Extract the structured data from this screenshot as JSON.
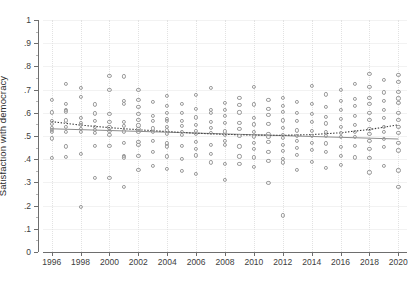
{
  "figure": {
    "background": "#ffffff",
    "marker_color": "#9a9a9a",
    "linear_fit_color": "#8c8c8c",
    "curve_fit_color": "#3a3a3a"
  },
  "axes": {
    "y_title": "Satisfaction with democracy",
    "x_title": "",
    "y_ticklabels": [
      "0",
      ".1",
      ".2",
      ".3",
      ".4",
      ".5",
      ".6",
      ".7",
      ".8",
      ".9",
      "1"
    ],
    "x_ticklabels": [
      "1996",
      "1998",
      "2000",
      "2002",
      "2004",
      "2006",
      "2008",
      "2010",
      "2012",
      "2014",
      "2016",
      "2018",
      "2020"
    ]
  },
  "chart_data": {
    "type": "scatter",
    "title": "",
    "xlabel": "",
    "ylabel": "Satisfaction with democracy",
    "xlim": [
      1995.4,
      2020.6
    ],
    "ylim": [
      0,
      1
    ],
    "ytick_values": [
      0,
      0.1,
      0.2,
      0.3,
      0.4,
      0.5,
      0.6,
      0.7,
      0.8,
      0.9,
      1
    ],
    "xtick_values": [
      1996,
      1998,
      2000,
      2002,
      2004,
      2006,
      2008,
      2010,
      2012,
      2014,
      2016,
      2018,
      2020
    ],
    "grid": "horizontal solid light gray, vertical dotted light gray",
    "legend": "none",
    "marker": "open circle",
    "points": [
      [
        1996,
        0.655
      ],
      [
        1996,
        0.602
      ],
      [
        1996,
        0.565
      ],
      [
        1996,
        0.553
      ],
      [
        1996,
        0.535
      ],
      [
        1996,
        0.527
      ],
      [
        1996,
        0.519
      ],
      [
        1996,
        0.49
      ],
      [
        1996,
        0.404
      ],
      [
        1997,
        0.724
      ],
      [
        1997,
        0.638
      ],
      [
        1997,
        0.614
      ],
      [
        1997,
        0.606
      ],
      [
        1997,
        0.567
      ],
      [
        1997,
        0.54
      ],
      [
        1997,
        0.519
      ],
      [
        1997,
        0.455
      ],
      [
        1997,
        0.409
      ],
      [
        1998,
        0.708
      ],
      [
        1998,
        0.668
      ],
      [
        1998,
        0.578
      ],
      [
        1998,
        0.556
      ],
      [
        1998,
        0.548
      ],
      [
        1998,
        0.532
      ],
      [
        1998,
        0.519
      ],
      [
        1998,
        0.423
      ],
      [
        1998,
        0.196
      ],
      [
        1999,
        0.636
      ],
      [
        1999,
        0.597
      ],
      [
        1999,
        0.566
      ],
      [
        1999,
        0.538
      ],
      [
        1999,
        0.528
      ],
      [
        1999,
        0.512
      ],
      [
        1999,
        0.456
      ],
      [
        1999,
        0.32
      ],
      [
        2000,
        0.76
      ],
      [
        2000,
        0.7
      ],
      [
        2000,
        0.595
      ],
      [
        2000,
        0.561
      ],
      [
        2000,
        0.537
      ],
      [
        2000,
        0.523
      ],
      [
        2000,
        0.503
      ],
      [
        2000,
        0.459
      ],
      [
        2000,
        0.32
      ],
      [
        2001,
        0.757
      ],
      [
        2001,
        0.651
      ],
      [
        2001,
        0.638
      ],
      [
        2001,
        0.56
      ],
      [
        2001,
        0.545
      ],
      [
        2001,
        0.52
      ],
      [
        2001,
        0.47
      ],
      [
        2001,
        0.415
      ],
      [
        2001,
        0.408
      ],
      [
        2001,
        0.279
      ],
      [
        2002,
        0.7
      ],
      [
        2002,
        0.655
      ],
      [
        2002,
        0.627
      ],
      [
        2002,
        0.596
      ],
      [
        2002,
        0.57
      ],
      [
        2002,
        0.546
      ],
      [
        2002,
        0.53
      ],
      [
        2002,
        0.52
      ],
      [
        2002,
        0.474
      ],
      [
        2002,
        0.462
      ],
      [
        2002,
        0.415
      ],
      [
        2002,
        0.355
      ],
      [
        2003,
        0.648
      ],
      [
        2003,
        0.588
      ],
      [
        2003,
        0.565
      ],
      [
        2003,
        0.533
      ],
      [
        2003,
        0.517
      ],
      [
        2003,
        0.48
      ],
      [
        2003,
        0.43
      ],
      [
        2003,
        0.372
      ],
      [
        2004,
        0.672
      ],
      [
        2004,
        0.63
      ],
      [
        2004,
        0.601
      ],
      [
        2004,
        0.575
      ],
      [
        2004,
        0.564
      ],
      [
        2004,
        0.538
      ],
      [
        2004,
        0.524
      ],
      [
        2004,
        0.509
      ],
      [
        2004,
        0.468
      ],
      [
        2004,
        0.455
      ],
      [
        2004,
        0.412
      ],
      [
        2004,
        0.359
      ],
      [
        2005,
        0.64
      ],
      [
        2005,
        0.598
      ],
      [
        2005,
        0.566
      ],
      [
        2005,
        0.545
      ],
      [
        2005,
        0.518
      ],
      [
        2005,
        0.505
      ],
      [
        2005,
        0.458
      ],
      [
        2005,
        0.4
      ],
      [
        2005,
        0.351
      ],
      [
        2006,
        0.676
      ],
      [
        2006,
        0.618
      ],
      [
        2006,
        0.58
      ],
      [
        2006,
        0.548
      ],
      [
        2006,
        0.521
      ],
      [
        2006,
        0.51
      ],
      [
        2006,
        0.473
      ],
      [
        2006,
        0.443
      ],
      [
        2006,
        0.416
      ],
      [
        2006,
        0.338
      ],
      [
        2007,
        0.706
      ],
      [
        2007,
        0.612
      ],
      [
        2007,
        0.598
      ],
      [
        2007,
        0.562
      ],
      [
        2007,
        0.536
      ],
      [
        2007,
        0.513
      ],
      [
        2007,
        0.462
      ],
      [
        2007,
        0.422
      ],
      [
        2007,
        0.386
      ],
      [
        2008,
        0.644
      ],
      [
        2008,
        0.612
      ],
      [
        2008,
        0.588
      ],
      [
        2008,
        0.556
      ],
      [
        2008,
        0.52
      ],
      [
        2008,
        0.505
      ],
      [
        2008,
        0.478
      ],
      [
        2008,
        0.46
      ],
      [
        2008,
        0.381
      ],
      [
        2008,
        0.31
      ],
      [
        2009,
        0.663
      ],
      [
        2009,
        0.635
      ],
      [
        2009,
        0.602
      ],
      [
        2009,
        0.558
      ],
      [
        2009,
        0.53
      ],
      [
        2009,
        0.5
      ],
      [
        2009,
        0.455
      ],
      [
        2009,
        0.412
      ],
      [
        2009,
        0.38
      ],
      [
        2010,
        0.713
      ],
      [
        2010,
        0.636
      ],
      [
        2010,
        0.578
      ],
      [
        2010,
        0.55
      ],
      [
        2010,
        0.516
      ],
      [
        2010,
        0.498
      ],
      [
        2010,
        0.47
      ],
      [
        2010,
        0.444
      ],
      [
        2010,
        0.408
      ],
      [
        2010,
        0.368
      ],
      [
        2011,
        0.657
      ],
      [
        2011,
        0.618
      ],
      [
        2011,
        0.59
      ],
      [
        2011,
        0.551
      ],
      [
        2011,
        0.508
      ],
      [
        2011,
        0.495
      ],
      [
        2011,
        0.475
      ],
      [
        2011,
        0.43
      ],
      [
        2011,
        0.393
      ],
      [
        2011,
        0.297
      ],
      [
        2012,
        0.663
      ],
      [
        2012,
        0.631
      ],
      [
        2012,
        0.604
      ],
      [
        2012,
        0.567
      ],
      [
        2012,
        0.536
      ],
      [
        2012,
        0.506
      ],
      [
        2012,
        0.491
      ],
      [
        2012,
        0.463
      ],
      [
        2012,
        0.437
      ],
      [
        2012,
        0.403
      ],
      [
        2012,
        0.386
      ],
      [
        2012,
        0.158
      ],
      [
        2013,
        0.648
      ],
      [
        2013,
        0.6
      ],
      [
        2013,
        0.566
      ],
      [
        2013,
        0.524
      ],
      [
        2013,
        0.501
      ],
      [
        2013,
        0.48
      ],
      [
        2013,
        0.447
      ],
      [
        2013,
        0.418
      ],
      [
        2013,
        0.355
      ],
      [
        2014,
        0.717
      ],
      [
        2014,
        0.64
      ],
      [
        2014,
        0.596
      ],
      [
        2014,
        0.561
      ],
      [
        2014,
        0.521
      ],
      [
        2014,
        0.502
      ],
      [
        2014,
        0.471
      ],
      [
        2014,
        0.44
      ],
      [
        2014,
        0.39
      ],
      [
        2015,
        0.679
      ],
      [
        2015,
        0.625
      ],
      [
        2015,
        0.584
      ],
      [
        2015,
        0.554
      ],
      [
        2015,
        0.517
      ],
      [
        2015,
        0.5
      ],
      [
        2015,
        0.468
      ],
      [
        2015,
        0.43
      ],
      [
        2015,
        0.364
      ],
      [
        2016,
        0.697
      ],
      [
        2016,
        0.652
      ],
      [
        2016,
        0.613
      ],
      [
        2016,
        0.572
      ],
      [
        2016,
        0.54
      ],
      [
        2016,
        0.512
      ],
      [
        2016,
        0.495
      ],
      [
        2016,
        0.452
      ],
      [
        2016,
        0.415
      ],
      [
        2016,
        0.377
      ],
      [
        2017,
        0.723
      ],
      [
        2017,
        0.66
      ],
      [
        2017,
        0.628
      ],
      [
        2017,
        0.586
      ],
      [
        2017,
        0.549
      ],
      [
        2017,
        0.517
      ],
      [
        2017,
        0.497
      ],
      [
        2017,
        0.458
      ],
      [
        2017,
        0.408
      ],
      [
        2018,
        0.768
      ],
      [
        2018,
        0.712
      ],
      [
        2018,
        0.664
      ],
      [
        2018,
        0.64
      ],
      [
        2018,
        0.601
      ],
      [
        2018,
        0.57
      ],
      [
        2018,
        0.531
      ],
      [
        2018,
        0.509
      ],
      [
        2018,
        0.48
      ],
      [
        2018,
        0.443
      ],
      [
        2018,
        0.407
      ],
      [
        2018,
        0.343
      ],
      [
        2019,
        0.742
      ],
      [
        2019,
        0.688
      ],
      [
        2019,
        0.65
      ],
      [
        2019,
        0.612
      ],
      [
        2019,
        0.578
      ],
      [
        2019,
        0.54
      ],
      [
        2019,
        0.518
      ],
      [
        2019,
        0.486
      ],
      [
        2019,
        0.452
      ],
      [
        2019,
        0.372
      ],
      [
        2020,
        0.765
      ],
      [
        2020,
        0.733
      ],
      [
        2020,
        0.69
      ],
      [
        2020,
        0.662
      ],
      [
        2020,
        0.641
      ],
      [
        2020,
        0.6
      ],
      [
        2020,
        0.57
      ],
      [
        2020,
        0.538
      ],
      [
        2020,
        0.512
      ],
      [
        2020,
        0.47
      ],
      [
        2020,
        0.438
      ],
      [
        2020,
        0.352
      ],
      [
        2020,
        0.281
      ]
    ],
    "fits": [
      {
        "name": "linear-fit",
        "style": "solid",
        "color": "#8c8c8c",
        "x": [
          1996,
          2020
        ],
        "y": [
          0.531,
          0.487
        ]
      },
      {
        "name": "quadratic-fit",
        "style": "dotted",
        "color": "#3a3a3a",
        "x": [
          1996,
          1998,
          2000,
          2002,
          2004,
          2006,
          2008,
          2010,
          2012,
          2014,
          2016,
          2018,
          2020
        ],
        "y": [
          0.562,
          0.547,
          0.536,
          0.527,
          0.519,
          0.512,
          0.507,
          0.504,
          0.503,
          0.506,
          0.514,
          0.528,
          0.548
        ]
      }
    ]
  }
}
